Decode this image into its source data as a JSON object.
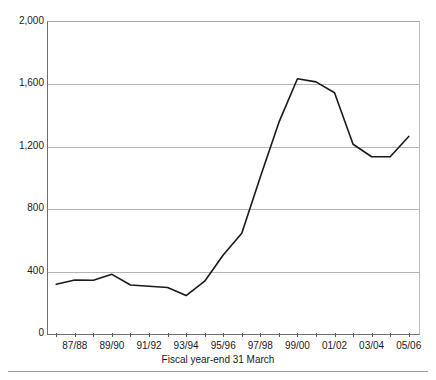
{
  "chart_data": {
    "type": "line",
    "title": "",
    "subtitle": "",
    "xlabel": "Fiscal year-end 31 March",
    "ylabel": "",
    "grid": true,
    "legend": "none",
    "xlim": [
      0,
      19
    ],
    "ylim": [
      0,
      2000
    ],
    "ytick_labels": [
      "0",
      "400",
      "800",
      "1,200",
      "1,600",
      "2,000"
    ],
    "ytick_values": [
      0,
      400,
      800,
      1200,
      1600,
      2000
    ],
    "xtick_labels": [
      "87/88",
      "89/90",
      "91/92",
      "93/94",
      "95/96",
      "97/98",
      "99/00",
      "01/02",
      "03/04",
      "05/06"
    ],
    "categories": [
      "86/87",
      "87/88",
      "88/89",
      "89/90",
      "90/91",
      "91/92",
      "92/93",
      "93/94",
      "94/95",
      "95/96",
      "96/97",
      "97/98",
      "98/99",
      "99/00",
      "00/01",
      "01/02",
      "02/03",
      "03/04",
      "04/05",
      "05/06"
    ],
    "values": [
      312,
      340,
      338,
      376,
      308,
      300,
      292,
      240,
      332,
      500,
      640,
      1000,
      1350,
      1630,
      1610,
      1540,
      1210,
      1130,
      1130,
      1260
    ],
    "series": [
      {
        "name": "value",
        "color": "#1a1a1a",
        "values": [
          312,
          340,
          338,
          376,
          308,
          300,
          292,
          240,
          332,
          500,
          640,
          1000,
          1350,
          1630,
          1610,
          1540,
          1210,
          1130,
          1130,
          1260
        ]
      }
    ],
    "line_color": "#1a1a1a",
    "line_width": 1.6,
    "grid_color": "#b4b4b4",
    "axis_color": "#6e6e6e",
    "background": "#ffffff"
  }
}
